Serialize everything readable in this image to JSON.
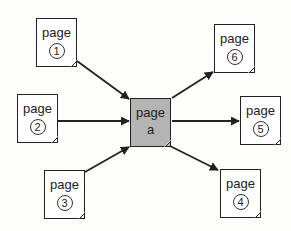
{
  "diagram": {
    "type": "link-graph",
    "center": {
      "id": "a",
      "label": "page",
      "sub": "a",
      "fill": "#b4b4b4"
    },
    "inbound": [
      {
        "id": "1",
        "label": "page",
        "num": "1"
      },
      {
        "id": "2",
        "label": "page",
        "num": "2"
      },
      {
        "id": "3",
        "label": "page",
        "num": "3"
      }
    ],
    "outbound": [
      {
        "id": "6",
        "label": "page",
        "num": "6"
      },
      {
        "id": "5",
        "label": "page",
        "num": "5"
      },
      {
        "id": "4",
        "label": "page",
        "num": "4"
      }
    ],
    "edges": [
      {
        "from": "1",
        "to": "a"
      },
      {
        "from": "2",
        "to": "a"
      },
      {
        "from": "3",
        "to": "a"
      },
      {
        "from": "a",
        "to": "6"
      },
      {
        "from": "a",
        "to": "5"
      },
      {
        "from": "a",
        "to": "4"
      }
    ],
    "colors": {
      "stroke": "#222222",
      "page_bg": "#ffffff",
      "center_bg": "#b4b4b4"
    }
  }
}
